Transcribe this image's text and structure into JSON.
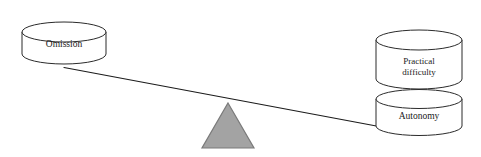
{
  "diagram": {
    "background_color": "#ffffff",
    "stroke_color": "#2b2b2b",
    "fulcrum_fill_color": "#a3a3a3",
    "fulcrum_stroke_color": "#7a7a7a",
    "text_color": "#1a1a1a",
    "left_side": {
      "cylinders": [
        {
          "id": "omission",
          "label": "Omission",
          "label_lines": [
            "Omission"
          ]
        }
      ]
    },
    "right_side": {
      "cylinders": [
        {
          "id": "practical-difficulty",
          "label": "Practical difficulty",
          "label_lines": [
            "Practical",
            "difficulty"
          ]
        },
        {
          "id": "autonomy",
          "label": "Autonomy",
          "label_lines": [
            "Autonomy"
          ]
        }
      ]
    },
    "fulcrum": {
      "id": "fulcrum-triangle",
      "shape": "triangle"
    },
    "beam": {
      "id": "balance-beam",
      "tilt": "right-side-down"
    }
  }
}
